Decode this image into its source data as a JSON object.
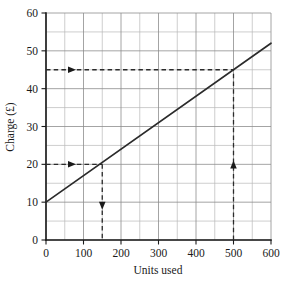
{
  "chart_data": {
    "type": "line",
    "title": "",
    "xlabel": "Units used",
    "ylabel": "Charge (£)",
    "xlim": [
      0,
      600
    ],
    "ylim": [
      0,
      60
    ],
    "grid": true,
    "legend": "none",
    "x_ticks": [
      0,
      100,
      200,
      300,
      400,
      500,
      600
    ],
    "x_tick_labels": [
      "0",
      "100",
      "200",
      "300",
      "400",
      "500",
      "600"
    ],
    "x_minor_step": 50,
    "y_ticks": [
      0,
      10,
      20,
      30,
      40,
      50,
      60
    ],
    "y_tick_labels": [
      "0",
      "10",
      "20",
      "30",
      "40",
      "50",
      "60"
    ],
    "y_minor_step": 5,
    "series": [
      {
        "name": "Charge",
        "x": [
          0,
          600
        ],
        "values": [
          10,
          52
        ],
        "intercept": 10,
        "slope": 0.07
      }
    ],
    "annotations": [
      {
        "name": "read-off-150-units",
        "horizontal": {
          "y": 20,
          "x_from": 0,
          "x_to": 150,
          "arrow": "right",
          "arrow_at_x": 80
        },
        "vertical": {
          "x": 150,
          "y_from": 20,
          "y_to": 0,
          "arrow": "down",
          "arrow_at_y": 8
        }
      },
      {
        "name": "read-off-45-pounds",
        "horizontal": {
          "y": 45,
          "x_from": 0,
          "x_to": 500,
          "arrow": "right",
          "arrow_at_x": 80
        },
        "vertical": {
          "x": 500,
          "y_from": 0,
          "y_to": 45,
          "arrow": "up",
          "arrow_at_y": 21
        }
      }
    ]
  },
  "axis": {
    "x_title": "Units used",
    "y_title": "Charge (£)"
  }
}
